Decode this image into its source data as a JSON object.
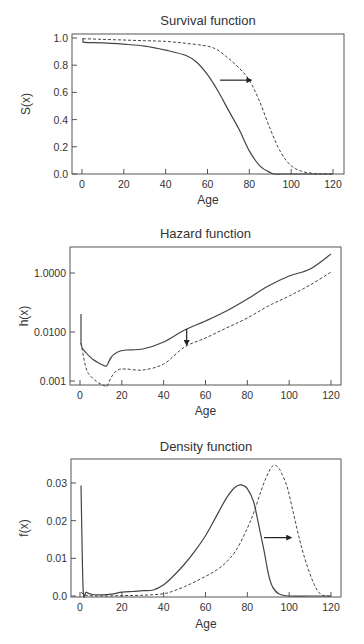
{
  "chart_data": [
    {
      "type": "line",
      "title": "Survival function",
      "xlabel": "Age",
      "ylabel": "S(x)",
      "xlim": [
        0,
        120
      ],
      "ylim": [
        0,
        1.0
      ],
      "yscale": "linear",
      "xticks": [
        0,
        20,
        40,
        60,
        80,
        100,
        120
      ],
      "yticks": [
        0.0,
        0.2,
        0.4,
        0.6,
        0.8,
        1.0
      ],
      "ytick_labels": [
        "0.0",
        "0.2",
        "0.4",
        "0.6",
        "0.8",
        "1.0"
      ],
      "grid": false,
      "legend": null,
      "annotation": {
        "type": "arrow",
        "direction": "right",
        "from": [
          66,
          0.69
        ],
        "to": [
          81,
          0.69
        ]
      },
      "series": [
        {
          "name": "baseline",
          "style": "solid",
          "x": [
            0.5,
            0.5,
            10,
            20,
            30,
            40,
            50,
            55,
            60,
            65,
            70,
            75,
            80,
            85,
            90,
            92,
            95,
            100,
            110,
            120
          ],
          "y": [
            1.0,
            0.97,
            0.965,
            0.955,
            0.94,
            0.91,
            0.87,
            0.82,
            0.73,
            0.61,
            0.47,
            0.33,
            0.17,
            0.06,
            0.01,
            0.0,
            0.0,
            0.0,
            0.0,
            0.0
          ]
        },
        {
          "name": "shifted",
          "style": "dashed",
          "x": [
            0.5,
            10,
            20,
            30,
            40,
            50,
            60,
            65,
            70,
            75,
            80,
            85,
            90,
            95,
            100,
            105,
            110,
            115,
            120
          ],
          "y": [
            0.995,
            0.99,
            0.985,
            0.98,
            0.975,
            0.96,
            0.94,
            0.91,
            0.85,
            0.78,
            0.69,
            0.53,
            0.33,
            0.16,
            0.06,
            0.02,
            0.005,
            0.0,
            0.0
          ]
        }
      ]
    },
    {
      "type": "line",
      "title": "Hazard function",
      "xlabel": "Age",
      "ylabel": "h(x)",
      "xlim": [
        0,
        120
      ],
      "yscale": "log",
      "xticks": [
        0,
        20,
        40,
        60,
        80,
        100,
        120
      ],
      "yticks_px": [
        {
          "label": "1.0000",
          "y": 273
        },
        {
          "label": "0.0100",
          "y": 332
        },
        {
          "label": "0.001",
          "y": 381
        }
      ],
      "ytick_labels": [
        "0.001",
        "0.0100",
        "1.0000"
      ],
      "grid": false,
      "legend": null,
      "annotation": {
        "type": "arrow",
        "direction": "down",
        "at_age": 51
      },
      "series": [
        {
          "name": "baseline",
          "style": "solid",
          "x": [
            0.5,
            0.5,
            3,
            6,
            9,
            12,
            13,
            15,
            18,
            22,
            30,
            40,
            50,
            60,
            70,
            80,
            90,
            100,
            110,
            120
          ],
          "y_px": [
            314,
            344,
            353,
            359,
            363,
            366,
            365,
            357,
            352,
            350,
            349,
            342,
            330,
            321,
            311,
            299,
            286,
            276,
            269,
            254
          ]
        },
        {
          "name": "shifted",
          "style": "dashed",
          "x": [
            0.5,
            3,
            6,
            9,
            12,
            13,
            15,
            18,
            22,
            30,
            40,
            50,
            60,
            70,
            80,
            90,
            100,
            110,
            120
          ],
          "y_px": [
            343,
            369,
            378,
            383,
            386,
            386,
            377,
            370,
            369,
            370,
            364,
            347,
            338,
            328,
            318,
            306,
            296,
            285,
            272
          ]
        }
      ]
    },
    {
      "type": "line",
      "title": "Density function",
      "xlabel": "Age",
      "ylabel": "f(x)",
      "xlim": [
        0,
        120
      ],
      "ylim": [
        0,
        0.035
      ],
      "yscale": "linear",
      "xticks": [
        0,
        20,
        40,
        60,
        80,
        100,
        120
      ],
      "yticks": [
        0.0,
        0.01,
        0.02,
        0.03
      ],
      "ytick_labels": [
        "0.0",
        "0.01",
        "0.02",
        "0.03"
      ],
      "grid": false,
      "legend": null,
      "annotation": {
        "type": "arrow",
        "direction": "right",
        "from": [
          88,
          0.0155
        ],
        "to": [
          101,
          0.0155
        ]
      },
      "series": [
        {
          "name": "baseline",
          "style": "solid",
          "x": [
            0.5,
            1.5,
            3,
            6,
            10,
            15,
            20,
            25,
            30,
            35,
            40,
            45,
            50,
            55,
            60,
            65,
            70,
            74,
            77,
            80,
            83,
            85,
            88,
            90,
            92,
            95,
            100,
            110,
            120
          ],
          "y": [
            0.0293,
            0.002,
            0.001,
            0.0004,
            0.0003,
            0.0005,
            0.001,
            0.0012,
            0.0014,
            0.0016,
            0.003,
            0.0055,
            0.0085,
            0.012,
            0.016,
            0.021,
            0.026,
            0.0288,
            0.0295,
            0.0285,
            0.025,
            0.02,
            0.012,
            0.006,
            0.0025,
            0.0006,
            0.0,
            0.0,
            0.0
          ]
        },
        {
          "name": "shifted",
          "style": "dashed",
          "x": [
            0.5,
            3,
            10,
            20,
            30,
            40,
            45,
            50,
            55,
            60,
            65,
            70,
            75,
            80,
            83,
            86,
            89,
            92,
            94,
            96,
            99,
            102,
            105,
            108,
            112,
            115,
            118,
            120
          ],
          "y": [
            0.001,
            0.0002,
            0.0,
            0.0001,
            0.0002,
            0.0006,
            0.0014,
            0.0025,
            0.0038,
            0.0052,
            0.0068,
            0.009,
            0.0125,
            0.018,
            0.022,
            0.027,
            0.0315,
            0.0345,
            0.0345,
            0.033,
            0.029,
            0.022,
            0.015,
            0.009,
            0.003,
            0.0005,
            0.0,
            0.0
          ]
        }
      ]
    }
  ],
  "layout": {
    "panels": [
      {
        "frame": {
          "left": 72,
          "top": 34,
          "right": 344,
          "bottom": 174
        },
        "x0px": 82,
        "x120px": 333,
        "ymin_px": 174,
        "ymax_px": 38,
        "title_y": 20,
        "xlabel_y": 200,
        "ylabel_x": 26
      },
      {
        "frame": {
          "left": 70,
          "top": 247,
          "right": 341,
          "bottom": 385
        },
        "x0px": 80,
        "x120px": 331,
        "title_y": 233,
        "xlabel_y": 411,
        "ylabel_x": 24
      },
      {
        "frame": {
          "left": 71,
          "top": 459,
          "right": 341,
          "bottom": 597
        },
        "x0px": 80,
        "x120px": 331,
        "ymin_px": 596,
        "ymax_px": 483,
        "ymax_val": 0.03,
        "title_y": 446,
        "xlabel_y": 624,
        "ylabel_x": 24
      }
    ],
    "colors": {
      "line": "#444444",
      "axis": "#555555",
      "text": "#333333"
    }
  }
}
